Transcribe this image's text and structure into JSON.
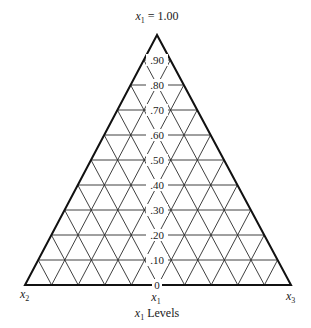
{
  "diagram": {
    "type": "ternary-grid",
    "apex_label": {
      "var": "x",
      "sub": "1",
      "suffix": " = 1.00"
    },
    "left_vertex_label": {
      "var": "x",
      "sub": "2"
    },
    "right_vertex_label": {
      "var": "x",
      "sub": "3"
    },
    "bottom_axis_label": {
      "var": "x",
      "sub": "1"
    },
    "caption": {
      "var": "x",
      "sub": "1",
      "suffix": " Levels"
    },
    "levels": [
      ".90",
      ".80",
      ".70",
      ".60",
      ".50",
      ".40",
      ".30",
      ".20",
      ".10",
      "0"
    ],
    "divisions": 10,
    "geometry": {
      "apex": [
        157,
        35
      ],
      "left": [
        25,
        285
      ],
      "right": [
        291,
        285
      ]
    },
    "colors": {
      "line": "#2a2a2a",
      "outline": "#111111",
      "background": "#ffffff"
    }
  }
}
